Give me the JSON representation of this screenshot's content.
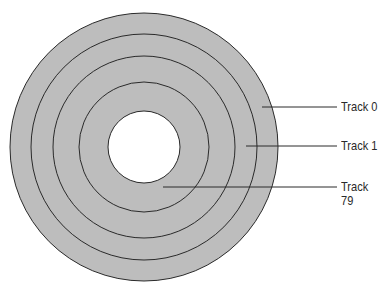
{
  "diagram": {
    "type": "disk-tracks",
    "colors": {
      "disk": "#bdbdbd",
      "stroke": "#2a2a2a",
      "hole": "#ffffff",
      "background": "#ffffff"
    },
    "center": {
      "x": 144,
      "y": 147
    },
    "disk_radius": 134,
    "track_rings": [
      113,
      91,
      65
    ],
    "hole_radius": 36,
    "labels": [
      {
        "text": "Track 0",
        "line_from_x": 262,
        "line_to_x": 337,
        "y": 107
      },
      {
        "text": "Track 1",
        "line_from_x": 246,
        "line_to_x": 337,
        "y": 146
      },
      {
        "text": "Track 79",
        "line_from_x": 163,
        "line_to_x": 337,
        "y": 187
      }
    ]
  }
}
